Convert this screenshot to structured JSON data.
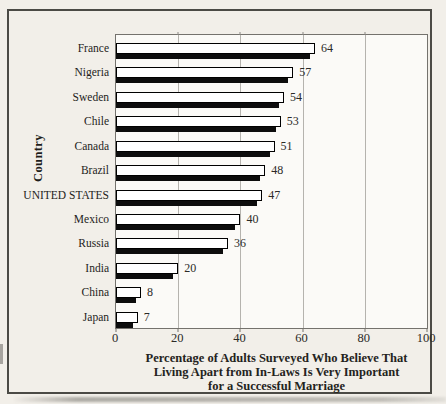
{
  "figure": {
    "y_axis_label": "Country",
    "x_axis_title_lines": [
      "Percentage of Adults Surveyed Who Believe That",
      "Living Apart from In-Laws Is Very Important",
      "for a Successful Marriage"
    ]
  },
  "chart_data": {
    "type": "bar",
    "orientation": "horizontal",
    "categories": [
      "France",
      "Nigeria",
      "Sweden",
      "Chile",
      "Canada",
      "Brazil",
      "UNITED STATES",
      "Mexico",
      "Russia",
      "India",
      "China",
      "Japan"
    ],
    "values": [
      64,
      57,
      54,
      53,
      51,
      48,
      47,
      40,
      36,
      20,
      8,
      7
    ],
    "value_labels": [
      "64",
      "57",
      "54",
      "53",
      "51",
      "48",
      "47",
      "40",
      "36",
      "20",
      "8",
      "7"
    ],
    "title": "Percentage of Adults Surveyed Who Believe That Living Apart from In-Laws Is Very Important for a Successful Marriage",
    "xlabel": "Percentage of Adults Surveyed Who Believe That Living Apart from In-Laws Is Very Important for a Successful Marriage",
    "ylabel": "Country",
    "xlim": [
      0,
      100
    ],
    "x_ticks": [
      0,
      20,
      40,
      60,
      80,
      100
    ],
    "grid": true,
    "legend": false,
    "bar_style": "white fill, black outline, black drop shadow offset down-left"
  },
  "colors": {
    "background": "#f2efe9",
    "plot_background": "#fbfaf7",
    "bar_fill": "#ffffff",
    "bar_outline": "#000000",
    "bar_shadow": "#0d0d0d",
    "gridline": "#b5b3ae",
    "plot_border": "#74726d",
    "frame_border": "#4b4a45",
    "text": "#1e1d1b"
  }
}
